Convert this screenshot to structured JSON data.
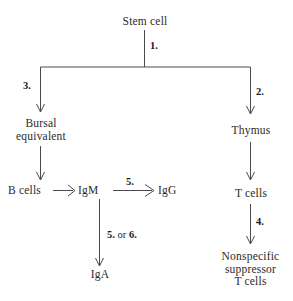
{
  "diagram": {
    "type": "flowchart",
    "background_color": "#ffffff",
    "line_color": "#4a4a4a",
    "text_color": "#2a2a2a",
    "nodes": [
      {
        "id": "stem_cell",
        "label": "Stem cell"
      },
      {
        "id": "bursal",
        "label": "Bursal\nequivalent"
      },
      {
        "id": "thymus",
        "label": "Thymus"
      },
      {
        "id": "b_cells",
        "label": "B cells"
      },
      {
        "id": "igm",
        "label": "IgM"
      },
      {
        "id": "igg",
        "label": "IgG"
      },
      {
        "id": "iga",
        "label": "IgA"
      },
      {
        "id": "t_cells",
        "label": "T cells"
      },
      {
        "id": "suppressor",
        "label": "Nonspecific\nsuppressor\nT cells"
      }
    ],
    "edge_labels": [
      {
        "id": "label_1",
        "text": "1."
      },
      {
        "id": "label_2",
        "text": "2."
      },
      {
        "id": "label_3",
        "text": "3."
      },
      {
        "id": "label_4",
        "text": "4."
      },
      {
        "id": "label_5",
        "text": "5."
      },
      {
        "id": "label_5_or_6_num1",
        "text": "5."
      },
      {
        "id": "label_5_or_6_conj",
        "text": "or"
      },
      {
        "id": "label_5_or_6_num2",
        "text": "6."
      }
    ]
  }
}
